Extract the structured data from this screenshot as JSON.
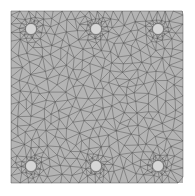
{
  "figure": {
    "type": "finite-element-triangular-mesh",
    "background": "#ffffff",
    "plate": {
      "x": 11,
      "y": 11,
      "width": 172,
      "height": 172,
      "fill": "#b4b4b4",
      "edge_color": "#4a4a4a"
    },
    "holes": [
      {
        "cx": 31,
        "cy": 29,
        "r": 5.5
      },
      {
        "cx": 96,
        "cy": 29,
        "r": 5.5
      },
      {
        "cx": 158,
        "cy": 29,
        "r": 5.5
      },
      {
        "cx": 31,
        "cy": 166,
        "r": 5.5
      },
      {
        "cx": 96,
        "cy": 166,
        "r": 5.5
      },
      {
        "cx": 158,
        "cy": 166,
        "r": 5.5
      }
    ],
    "hole_fill": "#d6d6d6",
    "element_size_far": 9,
    "element_size_near_hole": 2.2,
    "refinement_radius": 16
  }
}
